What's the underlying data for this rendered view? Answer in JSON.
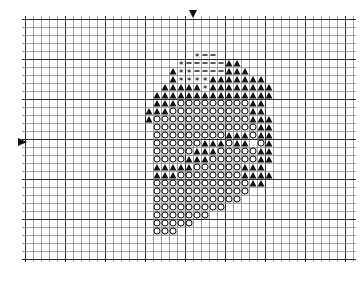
{
  "chart_data": {
    "type": "table",
    "title": "",
    "grid": {
      "origin_x": 25,
      "origin_y": 19,
      "cell": 8,
      "cols": 41,
      "rows": 30,
      "major_every": 5
    },
    "legend": {
      ".": "empty",
      "T": "filled-triangle",
      "O": "open-circle",
      "-": "dash",
      "*": "cross-asterisk"
    },
    "start_row": 4,
    "start_col": 12,
    "rows": [
      ".........*--........",
      ".......*-----TT.....",
      "......T**----TTT....",
      "......T****TTTTTTT..",
      ".....TTTTT*TTTTTTTT.",
      "....TTTTTTTTTTTTTTT.",
      "....TTTOOOOOOOOOTT..",
      "...TTTOOOOOOOOOOTT..",
      "...TOOOOOOOOOOOOTTT.",
      "....OOOOOOOOOOOOOTT.",
      "....OOOOOOOOOTTTOTT.",
      "....OOOOOOTTTOTT.OT.",
      "....OOOOOTTTOOOOOTT.",
      "....OOOOTTTOOOOOOTT.",
      "....TTTTTOOOOOOTTT..",
      "....TTTOOOOOOOOTTTT.",
      "....OOOOOOOOOOOOTT..",
      "....OOOOOOOOOOOO....",
      "....OOOOOOOOOOO.....",
      "....OOOOOOOOO.......",
      "....OOOOOOO.........",
      "....OOOOO...........",
      "....OOO............."
    ],
    "center_markers": [
      {
        "type": "down-arrow",
        "x": 193,
        "y": 14
      },
      {
        "type": "right-arrow",
        "x": 22,
        "y": 142
      }
    ]
  },
  "colors": {
    "grid_minor": "#8a8a8a",
    "grid_major": "#2a2a2a",
    "symbol": "#111111",
    "background": "#ffffff"
  }
}
